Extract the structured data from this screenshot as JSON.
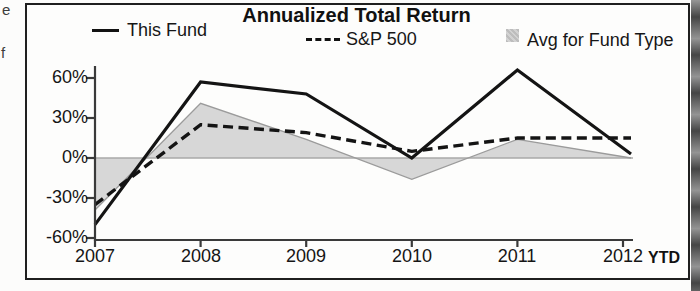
{
  "page": {
    "margin_fragments": [
      "e",
      "f"
    ]
  },
  "chart": {
    "title": "Annualized Total Return",
    "legend": [
      {
        "label": "This Fund",
        "marker": "solid-line"
      },
      {
        "label": "S&P 500",
        "marker": "dashed-line"
      },
      {
        "label": "Avg for Fund Type",
        "marker": "shaded-square"
      }
    ],
    "y_axis": {
      "labels": [
        "60%",
        "30%",
        "0%",
        "-30%",
        "-60%"
      ]
    },
    "x_axis": {
      "labels": [
        "2007",
        "2008",
        "2009",
        "2010",
        "2011",
        "2012"
      ],
      "suffix": "YTD"
    }
  },
  "chart_data": {
    "type": "line",
    "title": "Annualized Total Return",
    "x": [
      2007,
      2008,
      2009,
      2010,
      2011,
      2012
    ],
    "x_suffix_label": "YTD",
    "series": [
      {
        "name": "This Fund",
        "style": "solid",
        "color": "#141414",
        "values": [
          -50,
          57,
          48,
          0,
          66,
          3
        ]
      },
      {
        "name": "S&P 500",
        "style": "dashed",
        "color": "#141414",
        "values": [
          -35,
          25,
          19,
          5,
          15,
          15
        ]
      },
      {
        "name": "Avg for Fund Type",
        "style": "area",
        "color": "#cdcdcd",
        "values": [
          -39,
          41,
          14,
          -16,
          14,
          0
        ]
      }
    ],
    "ylim": [
      -60,
      60
    ],
    "yticks": [
      60,
      30,
      0,
      -30,
      -60
    ],
    "ytick_format": "percent",
    "grid": false,
    "zero_baseline": true,
    "legend_position": "top",
    "area_fill_color": "#cdcdcd",
    "axis_color": "#3a3a3a"
  }
}
